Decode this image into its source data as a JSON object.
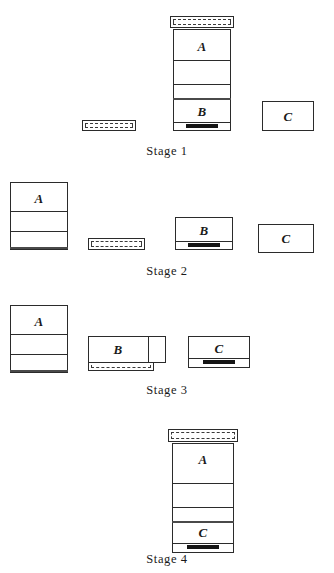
{
  "figure": {
    "background_color": "#ffffff",
    "ink_color": "#2b2b2b",
    "entrance_color": "#151515"
  },
  "stages": [
    {
      "id": "stage-1",
      "label": "Stage 1",
      "description": "Full hive stacked: cover on top, super A, empty super, brood box B with entrance block; loose cover at left; empty box C at right.",
      "parts": [
        {
          "name": "cover",
          "role": "cover",
          "label": ""
        },
        {
          "name": "box-a",
          "role": "super",
          "label": "A"
        },
        {
          "name": "box-empty",
          "role": "super",
          "label": ""
        },
        {
          "name": "box-b",
          "role": "brood-box",
          "label": "B"
        },
        {
          "name": "loose-cover",
          "role": "cover",
          "label": ""
        },
        {
          "name": "box-c",
          "role": "box",
          "label": "C"
        }
      ]
    },
    {
      "id": "stage-2",
      "label": "Stage 2",
      "description": "Stack A moved to the left; cover laid flat in the middle; box B with entrance block centre-right; box C at far right.",
      "parts": [
        {
          "name": "stack-a",
          "role": "super-stack",
          "label": "A"
        },
        {
          "name": "loose-cover",
          "role": "cover",
          "label": ""
        },
        {
          "name": "box-b",
          "role": "brood-box",
          "label": "B"
        },
        {
          "name": "box-c",
          "role": "box",
          "label": "C"
        }
      ]
    },
    {
      "id": "stage-3",
      "label": "Stage 3",
      "description": "Stack A at left; box B set upon the cover in the middle; box C with entrance block at right.",
      "parts": [
        {
          "name": "stack-a",
          "role": "super-stack",
          "label": "A"
        },
        {
          "name": "box-b",
          "role": "brood-box",
          "label": "B"
        },
        {
          "name": "cover-under-b",
          "role": "cover",
          "label": ""
        },
        {
          "name": "box-c",
          "role": "box",
          "label": "C"
        }
      ]
    },
    {
      "id": "stage-4",
      "label": "Stage 4",
      "description": "Re-assembled hive: cover, super A, two empty supers, box C with entrance block at bottom; box B stood on end at the right.",
      "parts": [
        {
          "name": "cover",
          "role": "cover",
          "label": ""
        },
        {
          "name": "box-a",
          "role": "super",
          "label": "A"
        },
        {
          "name": "box-empty-1",
          "role": "super",
          "label": ""
        },
        {
          "name": "box-empty-2",
          "role": "super",
          "label": ""
        },
        {
          "name": "box-c",
          "role": "box",
          "label": "C"
        },
        {
          "name": "box-b-on-end",
          "role": "brood-box",
          "label": "B"
        }
      ]
    }
  ],
  "labels": {
    "a": "A",
    "b": "B",
    "c": "C",
    "stage1": "Stage 1",
    "stage2": "Stage 2",
    "stage3": "Stage 3",
    "stage4": "Stage 4"
  }
}
